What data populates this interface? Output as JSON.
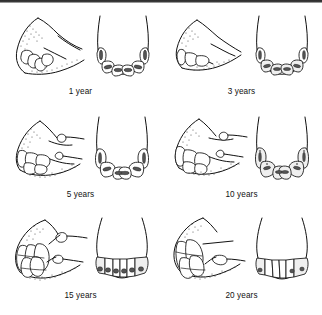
{
  "figure": {
    "layout": {
      "columns": 2,
      "rows": 3,
      "width": 322,
      "height": 315
    },
    "border": {
      "top_rule": true,
      "color": "#2b2b2b"
    },
    "colors": {
      "ink": "#111111",
      "background": "#ffffff",
      "tooth_fill": "#ffffff",
      "cup_fill": "#555555",
      "shade_fill": "#efefef"
    },
    "panels": [
      {
        "id": "panel-1-year",
        "label": "1 year",
        "views": [
          "lateral-profile",
          "occlusal-arcade"
        ],
        "incisor_count": 6,
        "notes": "Deciduous incisors, steeply angled profile, wide shell-shaped cups"
      },
      {
        "id": "panel-3-years",
        "label": "3 years",
        "views": [
          "lateral-profile",
          "occlusal-arcade"
        ],
        "incisor_count": 6,
        "notes": "Permanent central incisors erupting, short crowns"
      },
      {
        "id": "panel-5-years",
        "label": "5 years",
        "views": [
          "lateral-profile",
          "occlusal-arcade"
        ],
        "incisor_count": 6,
        "notes": "Full mouth, cups present in all incisors, canine tooth visible"
      },
      {
        "id": "panel-10-years",
        "label": "10 years",
        "views": [
          "lateral-profile",
          "occlusal-arcade"
        ],
        "incisor_count": 6,
        "notes": "Cups disappearing, dental stars forming, angle increasing"
      },
      {
        "id": "panel-15-years",
        "label": "15 years",
        "views": [
          "lateral-profile",
          "occlusal-arcade"
        ],
        "incisor_count": 6,
        "notes": "Teeth clearly angled forward, triangular occlusal surfaces"
      },
      {
        "id": "panel-20-years",
        "label": "20 years",
        "views": [
          "lateral-profile",
          "occlusal-arcade"
        ],
        "incisor_count": 6,
        "notes": "Sharply sloping long teeth, narrow triangular wear surfaces"
      }
    ]
  }
}
